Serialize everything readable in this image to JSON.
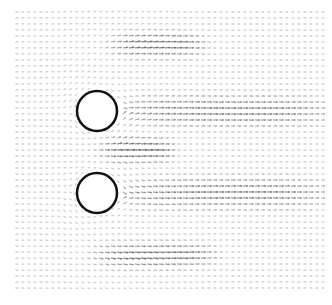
{
  "figure": {
    "width": 332,
    "height": 305,
    "background": "#ffffff",
    "field_extent": {
      "x0": 15,
      "y0": 12,
      "x1": 322,
      "y1": 292
    }
  },
  "chart_data": {
    "type": "quiver",
    "title": "",
    "xlabel": "",
    "ylabel": "",
    "axes_visible": false,
    "grid": false,
    "legend": null,
    "flow_direction": "left-to-right",
    "arrow_spacing_px": 6,
    "obstacles": [
      {
        "shape": "circle",
        "cx": 97,
        "cy": 111,
        "r": 20,
        "fill": "#ffffff",
        "stroke": "#111111"
      },
      {
        "shape": "circle",
        "cx": 97,
        "cy": 193,
        "r": 20,
        "fill": "#ffffff",
        "stroke": "#111111"
      }
    ],
    "high_speed_regions": [
      {
        "name": "upper-shear-band",
        "x_range": [
          110,
          200
        ],
        "y_center": 45,
        "intensity": 0.7
      },
      {
        "name": "gap-jet",
        "x_range": [
          100,
          170
        ],
        "y_center": 150,
        "intensity": 0.75
      },
      {
        "name": "lower-shear-band",
        "x_range": [
          95,
          210
        ],
        "y_center": 255,
        "intensity": 0.7
      },
      {
        "name": "upper-wake",
        "x_range": [
          115,
          322
        ],
        "y_center": 111,
        "intensity": 0.6
      },
      {
        "name": "lower-wake",
        "x_range": [
          115,
          322
        ],
        "y_center": 193,
        "intensity": 0.6
      }
    ],
    "colormap": {
      "low": "#e6e6e6",
      "high": "#3a3a3a"
    }
  }
}
